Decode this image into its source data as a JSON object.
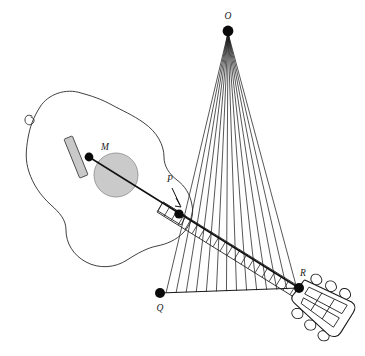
{
  "figure": {
    "background_color": "#ffffff",
    "ink_color": "#1a1a1a",
    "accent_gray": "#c9c9c9",
    "labels": [
      {
        "id": "label-O",
        "text": "O",
        "x": 228,
        "y": 19,
        "anchor": "middle"
      },
      {
        "id": "label-M",
        "text": "M",
        "x": 101,
        "y": 150,
        "anchor": "start"
      },
      {
        "id": "label-P",
        "text": "P",
        "x": 170,
        "y": 182,
        "anchor": "middle"
      },
      {
        "id": "label-Q",
        "text": "Q",
        "x": 160,
        "y": 311,
        "anchor": "middle"
      },
      {
        "id": "label-R",
        "text": "R",
        "x": 303,
        "y": 276,
        "anchor": "middle"
      }
    ],
    "points": [
      {
        "id": "point-O",
        "label": "O",
        "x": 228,
        "y": 31,
        "r": 5.4
      },
      {
        "id": "point-M",
        "label": "M",
        "x": 89,
        "y": 157,
        "r": 4.4
      },
      {
        "id": "point-P",
        "label": "P",
        "x": 179,
        "y": 214,
        "r": 4.6
      },
      {
        "id": "point-Q",
        "label": "Q",
        "x": 160,
        "y": 293,
        "r": 5.0
      },
      {
        "id": "point-R",
        "label": "R",
        "x": 299,
        "y": 288,
        "r": 5.0
      }
    ],
    "fan": {
      "apex_x": 228,
      "apex_y": 33,
      "line_count": 14,
      "base_start_x": 166,
      "base_start_y": 293,
      "base_end_x": 297,
      "base_end_y": 289
    },
    "baseline": {
      "from": "Q",
      "to": "R",
      "x1": 160,
      "y1": 293,
      "x2": 299,
      "y2": 288
    },
    "string_axis": {
      "from": "M",
      "to": "R",
      "x1": 89,
      "y1": 157,
      "x2": 299,
      "y2": 288
    },
    "fretboard": {
      "frets": 19,
      "from": "P",
      "to": "R"
    },
    "soundhole": {
      "cx": 116,
      "cy": 175,
      "r": 22
    },
    "bridge": {
      "cx": 76,
      "cy": 157,
      "width": 9,
      "height": 42,
      "rotation": -22
    },
    "headstock": {
      "tuning_pegs": 6,
      "slots": 2
    }
  }
}
